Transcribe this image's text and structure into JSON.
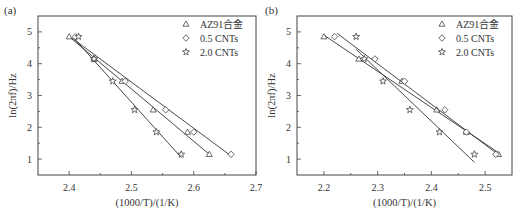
{
  "chart_data": [
    {
      "panel_label": "(a)",
      "type": "scatter",
      "xlabel": "(1000/T)/(1/K)",
      "ylabel": "ln(2πf)/Hz",
      "xlim": [
        2.35,
        2.7
      ],
      "ylim": [
        0.5,
        5.5
      ],
      "xticks": [
        "2.4",
        "2.5",
        "2.6",
        "2.7"
      ],
      "yticks": [
        "1",
        "2",
        "3",
        "4",
        "5"
      ],
      "legend_position": "upper right",
      "series": [
        {
          "name": "AZ91合金",
          "marker": "triangle",
          "x": [
            2.4,
            2.44,
            2.485,
            2.535,
            2.59,
            2.625
          ],
          "y": [
            4.85,
            4.15,
            3.45,
            2.55,
            1.85,
            1.15
          ],
          "fit": [
            [
              2.4,
              4.85
            ],
            [
              2.625,
              1.15
            ]
          ]
        },
        {
          "name": "0.5 CNTs",
          "marker": "diamond",
          "x": [
            2.41,
            2.44,
            2.49,
            2.555,
            2.6,
            2.66
          ],
          "y": [
            4.85,
            4.15,
            3.45,
            2.55,
            1.85,
            1.15
          ],
          "fit": [
            [
              2.405,
              4.8
            ],
            [
              2.66,
              1.1
            ]
          ]
        },
        {
          "name": "2.0 CNTs",
          "marker": "star",
          "x": [
            2.415,
            2.44,
            2.47,
            2.505,
            2.54,
            2.58
          ],
          "y": [
            4.85,
            4.15,
            3.45,
            2.55,
            1.85,
            1.15
          ],
          "fit": [
            [
              2.41,
              4.75
            ],
            [
              2.58,
              1.05
            ]
          ]
        }
      ]
    },
    {
      "panel_label": "(b)",
      "type": "scatter",
      "xlabel": "(1000/T)/(1/K)",
      "ylabel": "ln(2πf)/Hz",
      "xlim": [
        2.15,
        2.55
      ],
      "ylim": [
        0.5,
        5.5
      ],
      "xticks": [
        "2.2",
        "2.3",
        "2.4",
        "2.5"
      ],
      "yticks": [
        "1",
        "2",
        "3",
        "4",
        "5"
      ],
      "legend_position": "upper right",
      "series": [
        {
          "name": "AZ91合金",
          "marker": "triangle",
          "x": [
            2.2,
            2.265,
            2.345,
            2.41,
            2.465,
            2.525
          ],
          "y": [
            4.85,
            4.15,
            3.45,
            2.55,
            1.85,
            1.15
          ],
          "fit": [
            [
              2.2,
              4.9
            ],
            [
              2.525,
              1.2
            ]
          ]
        },
        {
          "name": "0.5 CNTs",
          "marker": "diamond",
          "x": [
            2.22,
            2.295,
            2.35,
            2.425,
            2.465,
            2.52
          ],
          "y": [
            4.85,
            4.15,
            3.45,
            2.55,
            1.85,
            1.15
          ],
          "fit": [
            [
              2.225,
              4.95
            ],
            [
              2.52,
              1.2
            ]
          ]
        },
        {
          "name": "2.0 CNTs",
          "marker": "star",
          "x": [
            2.26,
            2.275,
            2.31,
            2.36,
            2.415,
            2.48
          ],
          "y": [
            4.85,
            4.15,
            3.45,
            2.55,
            1.85,
            1.15
          ],
          "fit": [
            [
              2.26,
              4.45
            ],
            [
              2.48,
              0.9
            ]
          ]
        }
      ]
    }
  ],
  "panels": {
    "a": {
      "label": "(a)",
      "xlabel": "(1000/T)/(1/K)",
      "ylabel": "ln(2πf)/Hz",
      "xticks": [
        "2.4",
        "2.5",
        "2.6",
        "2.7"
      ],
      "yticks": [
        "1",
        "2",
        "3",
        "4",
        "5"
      ]
    },
    "b": {
      "label": "(b)",
      "xlabel": "(1000/T)/(1/K)",
      "ylabel": "ln(2πf)/Hz",
      "xticks": [
        "2.2",
        "2.3",
        "2.4",
        "2.5"
      ],
      "yticks": [
        "1",
        "2",
        "3",
        "4",
        "5"
      ]
    }
  },
  "legend": [
    "AZ91合金",
    "0.5 CNTs",
    "2.0 CNTs"
  ],
  "colors": {
    "axis": "#444444",
    "text": "#333333",
    "background": "#ffffff"
  }
}
